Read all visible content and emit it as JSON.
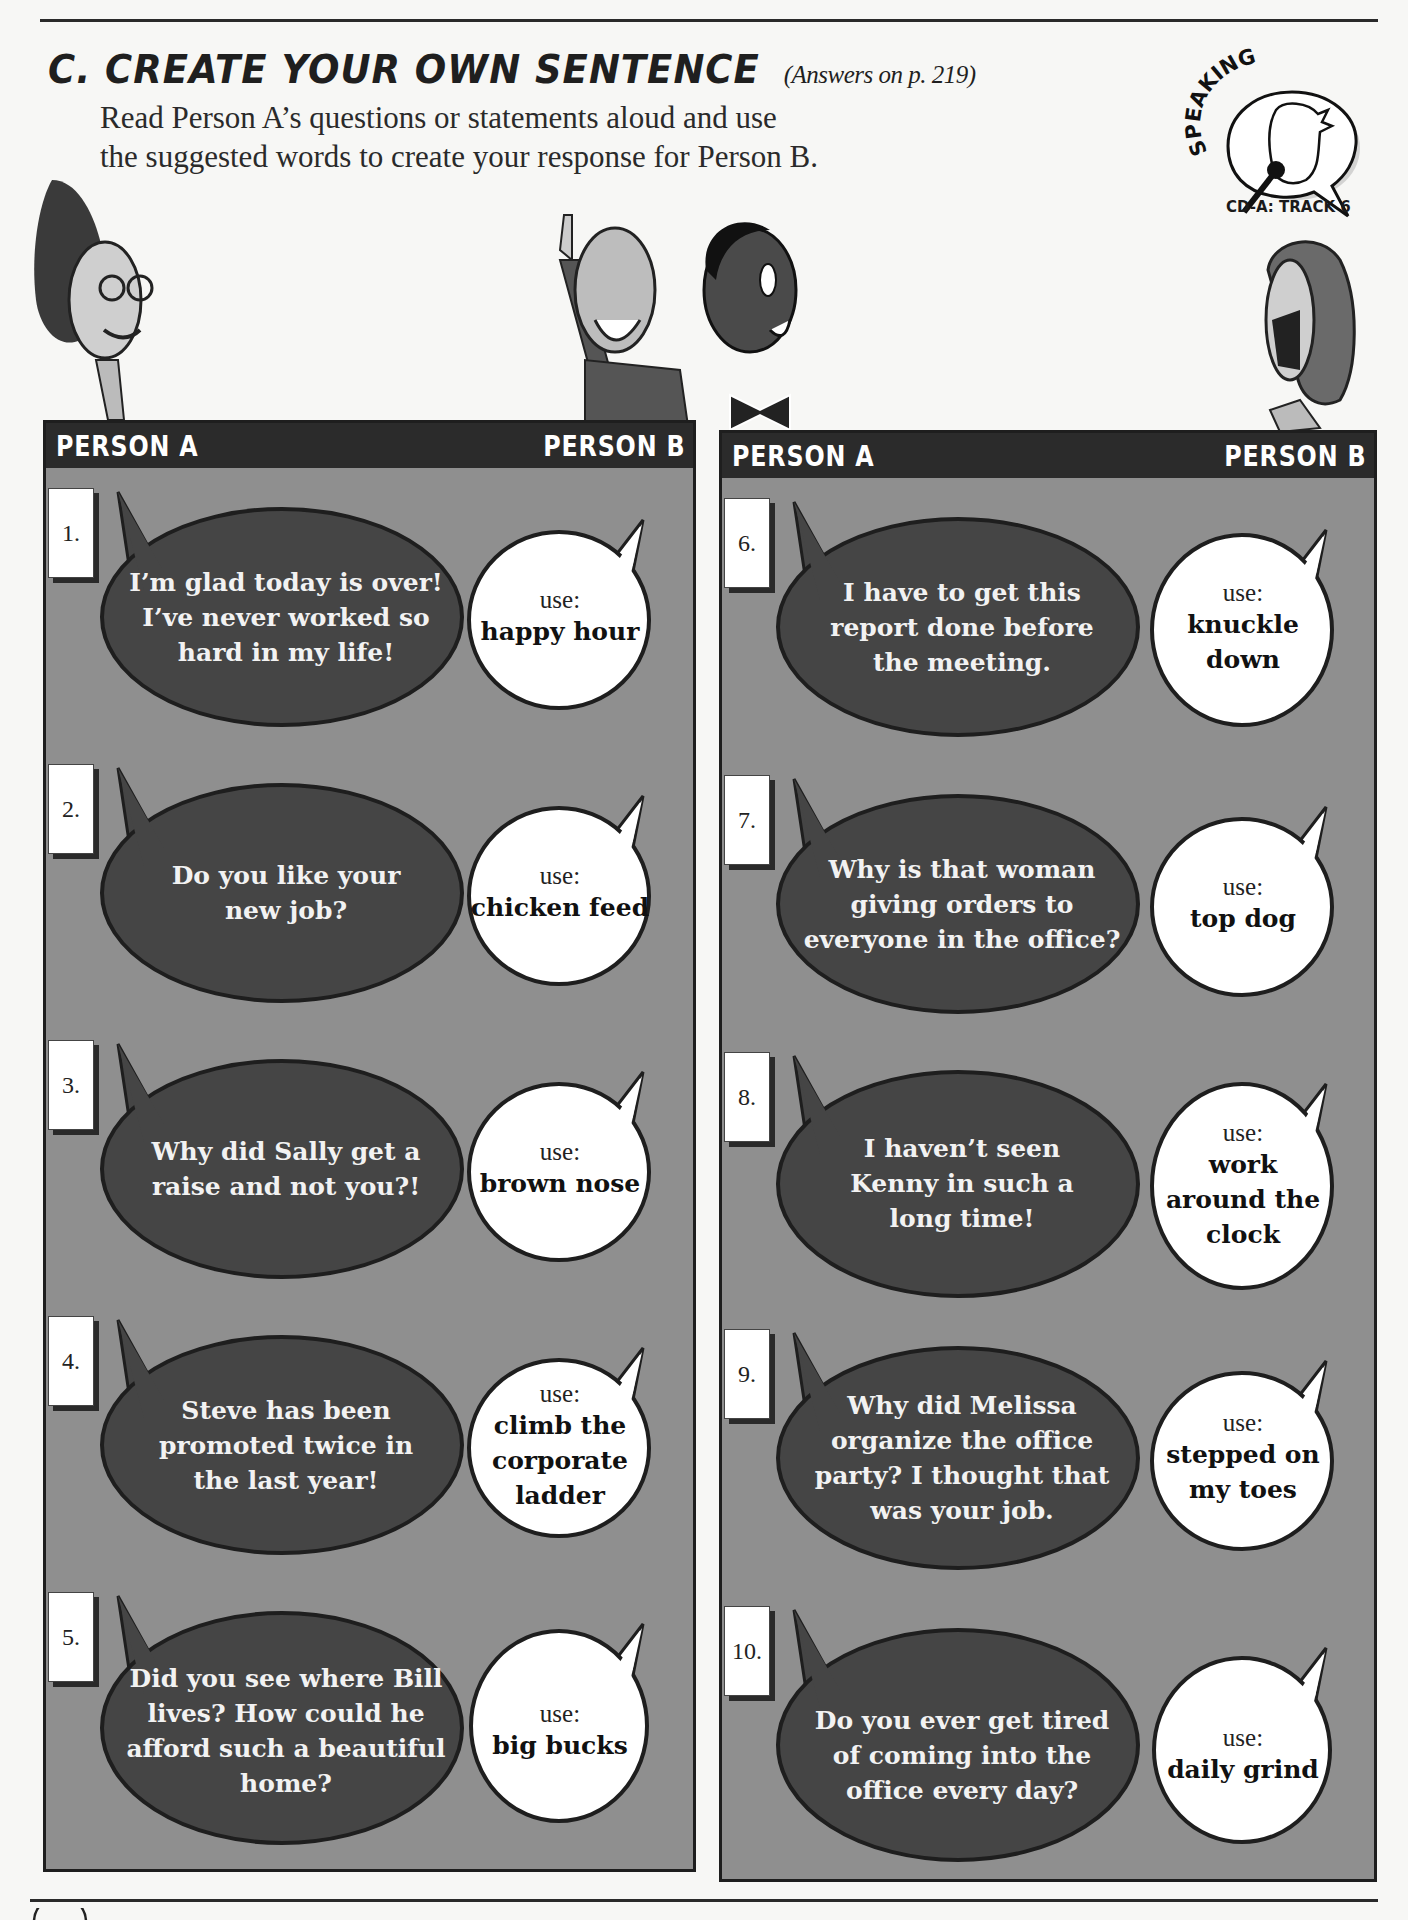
{
  "section": {
    "letter": "C.",
    "title": "CREATE YOUR OWN SENTENCE",
    "answers_ref": "(Answers on p. 219)",
    "instructions_line1": "Read Person A’s questions or statements aloud and use",
    "instructions_line2": "the suggested words to create your response for Person B."
  },
  "badge": {
    "label": "SPEAKING",
    "track": "CD-A: TRACK 6",
    "icon": "speaking-head-microphone-icon"
  },
  "panels": [
    {
      "header_left": "PERSON A",
      "header_right": "PERSON B",
      "items": [
        {
          "number": "1.",
          "person_a": "I’m glad today is over! I’ve never worked so hard in my life!",
          "use_label": "use:",
          "person_b_phrase": "happy hour"
        },
        {
          "number": "2.",
          "person_a": "Do you like your new job?",
          "use_label": "use:",
          "person_b_phrase": "chicken feed"
        },
        {
          "number": "3.",
          "person_a": "Why did Sally get a raise and not you?!",
          "use_label": "use:",
          "person_b_phrase": "brown nose"
        },
        {
          "number": "4.",
          "person_a": "Steve has been promoted twice in the last year!",
          "use_label": "use:",
          "person_b_phrase": "climb the corporate ladder"
        },
        {
          "number": "5.",
          "person_a": "Did you see where Bill lives? How could he afford such a beautiful home?",
          "use_label": "use:",
          "person_b_phrase": "big bucks"
        }
      ]
    },
    {
      "header_left": "PERSON A",
      "header_right": "PERSON B",
      "items": [
        {
          "number": "6.",
          "person_a": "I have to get this report done before the meeting.",
          "use_label": "use:",
          "person_b_phrase": "knuckle down"
        },
        {
          "number": "7.",
          "person_a": "Why is that woman giving orders to everyone in the office?",
          "use_label": "use:",
          "person_b_phrase": "top dog"
        },
        {
          "number": "8.",
          "person_a": "I haven’t seen Kenny in such a long time!",
          "use_label": "use:",
          "person_b_phrase": "work around the clock"
        },
        {
          "number": "9.",
          "person_a": "Why did Melissa organize the office party? I thought that was your job.",
          "use_label": "use:",
          "person_b_phrase": "stepped on my toes"
        },
        {
          "number": "10.",
          "person_a": "Do you ever get tired of coming into the office every day?",
          "use_label": "use:",
          "person_b_phrase": "daily grind"
        }
      ]
    }
  ],
  "colors": {
    "panel_bg": "#8f8f8f",
    "header_bg": "#2b2b2b",
    "bubble_a": "#454545",
    "bubble_b": "#ffffff",
    "outline": "#1e1e1e"
  }
}
